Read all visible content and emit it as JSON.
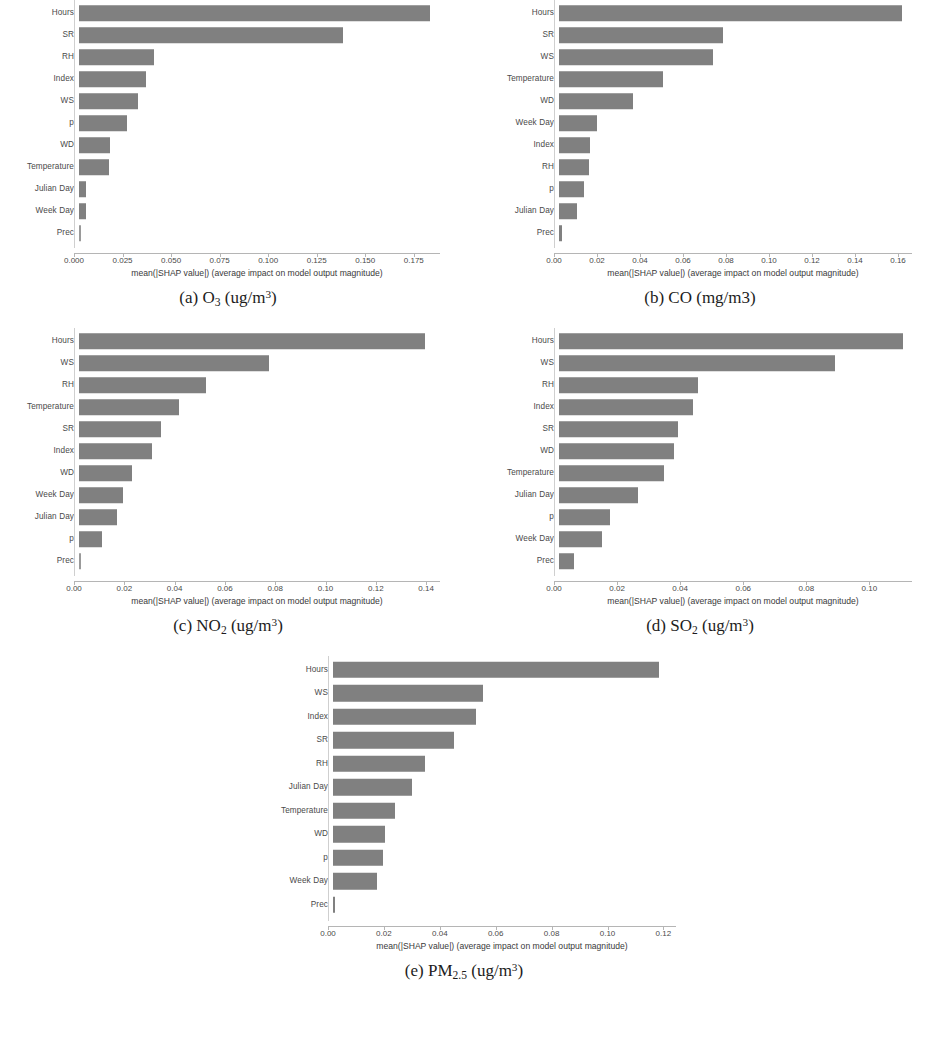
{
  "figure": {
    "bar_color": "#808080",
    "axis_color": "#b5b5b5",
    "xlabel": "mean(|SHAP value|) (average impact on model output magnitude)"
  },
  "panels": [
    {
      "key": "a",
      "caption_index": "(a)",
      "caption_species": "O",
      "caption_sub": "3",
      "caption_units_pre": "(ug/m",
      "caption_sup": "3",
      "caption_units_post": ")",
      "caption_plain": "(a) O3 (ug/m3)",
      "xlabel": "mean(|SHAP value|) (average impact on model output magnitude)",
      "ticks": [
        "0.000",
        "0.025",
        "0.050",
        "0.075",
        "0.100",
        "0.125",
        "0.150",
        "0.175"
      ],
      "tick_values": [
        0.0,
        0.025,
        0.05,
        0.075,
        0.1,
        0.125,
        0.15,
        0.175
      ],
      "xmax": 0.1885,
      "features": [
        "Hours",
        "SR",
        "RH",
        "Index",
        "WS",
        "p",
        "WD",
        "Temperature",
        "Julian Day",
        "Week Day",
        "Prec"
      ],
      "values": [
        0.181,
        0.136,
        0.0385,
        0.0345,
        0.0305,
        0.0245,
        0.016,
        0.0155,
        0.0035,
        0.0035,
        0.0
      ]
    },
    {
      "key": "b",
      "caption_index": "(b)",
      "caption_species": "CO",
      "caption_sub": "",
      "caption_units_pre": "(mg/m3",
      "caption_sup": "",
      "caption_units_post": ")",
      "caption_plain": "(b) CO (mg/m3)",
      "xlabel": "mean(|SHAP value|) (average impact on model output magnitude)",
      "ticks": [
        "0.00",
        "0.02",
        "0.04",
        "0.06",
        "0.08",
        "0.10",
        "0.12",
        "0.14",
        "0.16"
      ],
      "tick_values": [
        0.0,
        0.02,
        0.04,
        0.06,
        0.08,
        0.1,
        0.12,
        0.14,
        0.16
      ],
      "xmax": 0.1665,
      "features": [
        "Hours",
        "SR",
        "WS",
        "Temperature",
        "WD",
        "Week Day",
        "Index",
        "RH",
        "p",
        "Julian Day",
        "Prec"
      ],
      "values": [
        0.1595,
        0.0765,
        0.0715,
        0.0485,
        0.0345,
        0.0175,
        0.0142,
        0.0138,
        0.0118,
        0.0085,
        0.0012
      ]
    },
    {
      "key": "c",
      "caption_index": "(c)",
      "caption_species": "NO",
      "caption_sub": "2",
      "caption_units_pre": "(ug/m",
      "caption_sup": "3",
      "caption_units_post": ")",
      "caption_plain": "(c) NO2 (ug/m3)",
      "xlabel": "mean(|SHAP value|) (average impact on model output magnitude)",
      "ticks": [
        "0.00",
        "0.02",
        "0.04",
        "0.06",
        "0.08",
        "0.10",
        "0.12",
        "0.14"
      ],
      "tick_values": [
        0.0,
        0.02,
        0.04,
        0.06,
        0.08,
        0.1,
        0.12,
        0.14
      ],
      "xmax": 0.1455,
      "features": [
        "Hours",
        "WS",
        "RH",
        "Temperature",
        "SR",
        "Index",
        "WD",
        "Week Day",
        "Julian Day",
        "p",
        "Prec"
      ],
      "values": [
        0.1375,
        0.0755,
        0.0505,
        0.0398,
        0.0325,
        0.0292,
        0.0212,
        0.0175,
        0.0152,
        0.0092,
        0.0
      ]
    },
    {
      "key": "d",
      "caption_index": "(d)",
      "caption_species": "SO",
      "caption_sub": "2",
      "caption_units_pre": "(ug/m",
      "caption_sup": "3",
      "caption_units_post": ")",
      "caption_plain": "(d) SO2 (ug/m3)",
      "xlabel": "mean(|SHAP value|) (average impact on model output magnitude)",
      "ticks": [
        "0.00",
        "0.02",
        "0.04",
        "0.06",
        "0.08",
        "0.10"
      ],
      "tick_values": [
        0.0,
        0.02,
        0.04,
        0.06,
        0.08,
        0.1
      ],
      "xmax": 0.1135,
      "features": [
        "Hours",
        "WS",
        "RH",
        "Index",
        "SR",
        "WD",
        "Temperature",
        "Julian Day",
        "p",
        "Week Day",
        "Prec"
      ],
      "values": [
        0.109,
        0.0875,
        0.0442,
        0.0425,
        0.0378,
        0.0365,
        0.0332,
        0.0252,
        0.0162,
        0.0135,
        0.0048
      ]
    },
    {
      "key": "e",
      "caption_index": "(e)",
      "caption_species": "PM",
      "caption_sub": "2.5",
      "caption_units_pre": "(ug/m",
      "caption_sup": "3",
      "caption_units_post": ")",
      "caption_plain": "(e) PM2.5 (ug/m3)",
      "xlabel": "mean(|SHAP value|) (average impact on model output magnitude)",
      "ticks": [
        "0.00",
        "0.02",
        "0.04",
        "0.06",
        "0.08",
        "0.10",
        "0.12"
      ],
      "tick_values": [
        0.0,
        0.02,
        0.04,
        0.06,
        0.08,
        0.1,
        0.12
      ],
      "xmax": 0.1245,
      "features": [
        "Hours",
        "WS",
        "Index",
        "SR",
        "RH",
        "Julian Day",
        "Temperature",
        "WD",
        "p",
        "Week Day",
        "Prec"
      ],
      "values": [
        0.1165,
        0.0538,
        0.0512,
        0.0432,
        0.0328,
        0.0282,
        0.0222,
        0.0185,
        0.018,
        0.0158,
        0.0008
      ]
    }
  ],
  "chart_data": [
    {
      "type": "bar",
      "title": "(a) O3 (ug/m3)",
      "orientation": "horizontal",
      "xlabel": "mean(|SHAP value|) (average impact on model output magnitude)",
      "ylabel": "",
      "categories": [
        "Hours",
        "SR",
        "RH",
        "Index",
        "WS",
        "p",
        "WD",
        "Temperature",
        "Julian Day",
        "Week Day",
        "Prec"
      ],
      "values": [
        0.181,
        0.136,
        0.0385,
        0.0345,
        0.0305,
        0.0245,
        0.016,
        0.0155,
        0.0035,
        0.0035,
        0.0
      ],
      "xlim": [
        0.0,
        0.1885
      ],
      "xticks": [
        0.0,
        0.025,
        0.05,
        0.075,
        0.1,
        0.125,
        0.15,
        0.175
      ],
      "grid": false,
      "legend": "none"
    },
    {
      "type": "bar",
      "title": "(b) CO (mg/m3)",
      "orientation": "horizontal",
      "xlabel": "mean(|SHAP value|) (average impact on model output magnitude)",
      "ylabel": "",
      "categories": [
        "Hours",
        "SR",
        "WS",
        "Temperature",
        "WD",
        "Week Day",
        "Index",
        "RH",
        "p",
        "Julian Day",
        "Prec"
      ],
      "values": [
        0.1595,
        0.0765,
        0.0715,
        0.0485,
        0.0345,
        0.0175,
        0.0142,
        0.0138,
        0.0118,
        0.0085,
        0.0012
      ],
      "xlim": [
        0.0,
        0.1665
      ],
      "xticks": [
        0.0,
        0.02,
        0.04,
        0.06,
        0.08,
        0.1,
        0.12,
        0.14,
        0.16
      ],
      "grid": false,
      "legend": "none"
    },
    {
      "type": "bar",
      "title": "(c) NO2 (ug/m3)",
      "orientation": "horizontal",
      "xlabel": "mean(|SHAP value|) (average impact on model output magnitude)",
      "ylabel": "",
      "categories": [
        "Hours",
        "WS",
        "RH",
        "Temperature",
        "SR",
        "Index",
        "WD",
        "Week Day",
        "Julian Day",
        "p",
        "Prec"
      ],
      "values": [
        0.1375,
        0.0755,
        0.0505,
        0.0398,
        0.0325,
        0.0292,
        0.0212,
        0.0175,
        0.0152,
        0.0092,
        0.0
      ],
      "xlim": [
        0.0,
        0.1455
      ],
      "xticks": [
        0.0,
        0.02,
        0.04,
        0.06,
        0.08,
        0.1,
        0.12,
        0.14
      ],
      "grid": false,
      "legend": "none"
    },
    {
      "type": "bar",
      "title": "(d) SO2 (ug/m3)",
      "orientation": "horizontal",
      "xlabel": "mean(|SHAP value|) (average impact on model output magnitude)",
      "ylabel": "",
      "categories": [
        "Hours",
        "WS",
        "RH",
        "Index",
        "SR",
        "WD",
        "Temperature",
        "Julian Day",
        "p",
        "Week Day",
        "Prec"
      ],
      "values": [
        0.109,
        0.0875,
        0.0442,
        0.0425,
        0.0378,
        0.0365,
        0.0332,
        0.0252,
        0.0162,
        0.0135,
        0.0048
      ],
      "xlim": [
        0.0,
        0.1135
      ],
      "xticks": [
        0.0,
        0.02,
        0.04,
        0.06,
        0.08,
        0.1
      ],
      "grid": false,
      "legend": "none"
    },
    {
      "type": "bar",
      "title": "(e) PM2.5 (ug/m3)",
      "orientation": "horizontal",
      "xlabel": "mean(|SHAP value|) (average impact on model output magnitude)",
      "ylabel": "",
      "categories": [
        "Hours",
        "WS",
        "Index",
        "SR",
        "RH",
        "Julian Day",
        "Temperature",
        "WD",
        "p",
        "Week Day",
        "Prec"
      ],
      "values": [
        0.1165,
        0.0538,
        0.0512,
        0.0432,
        0.0328,
        0.0282,
        0.0222,
        0.0185,
        0.018,
        0.0158,
        0.0008
      ],
      "xlim": [
        0.0,
        0.1245
      ],
      "xticks": [
        0.0,
        0.02,
        0.04,
        0.06,
        0.08,
        0.1,
        0.12
      ],
      "grid": false,
      "legend": "none"
    }
  ]
}
